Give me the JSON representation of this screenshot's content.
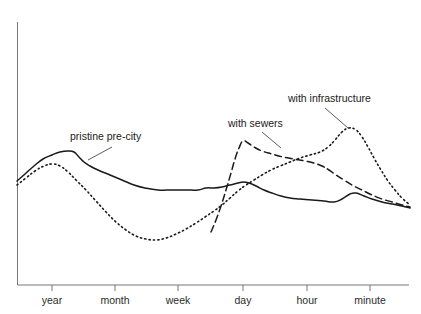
{
  "chart_data": {
    "type": "line",
    "title": "",
    "subtitle": "",
    "xlabel": "",
    "ylabel": "",
    "grid": false,
    "legend_position": "inline-annotations",
    "x_axis": {
      "tick_labels": [
        "year",
        "month",
        "week",
        "day",
        "hour",
        "minute"
      ],
      "tick_positions_px": [
        52,
        115,
        178,
        243,
        307,
        370
      ],
      "note": "logarithmic time-scale axis, decreasing timescale left to right"
    },
    "y_axis": {
      "tick_labels": [],
      "range_px": [
        22,
        285
      ],
      "note": "unlabeled vertical axis"
    },
    "series": [
      {
        "name": "pristine pre-city",
        "style": "solid",
        "color": "#1a1a1a",
        "label": "pristine pre-city",
        "label_x": 70,
        "label_y": 140,
        "leader": [
          [
            88,
            160
          ],
          [
            112,
            147
          ]
        ],
        "points": [
          [
            17,
            181
          ],
          [
            25,
            174
          ],
          [
            34,
            166
          ],
          [
            43,
            159
          ],
          [
            52,
            155
          ],
          [
            60,
            152
          ],
          [
            68,
            151
          ],
          [
            74,
            152
          ],
          [
            79,
            157
          ],
          [
            84,
            162
          ],
          [
            90,
            166
          ],
          [
            98,
            170
          ],
          [
            110,
            175
          ],
          [
            122,
            180
          ],
          [
            134,
            185
          ],
          [
            145,
            188
          ],
          [
            158,
            190
          ],
          [
            172,
            190
          ],
          [
            186,
            190
          ],
          [
            198,
            190
          ],
          [
            206,
            188
          ],
          [
            214,
            188
          ],
          [
            222,
            187
          ],
          [
            230,
            185
          ],
          [
            238,
            183
          ],
          [
            243,
            182
          ],
          [
            249,
            183
          ],
          [
            256,
            186
          ],
          [
            264,
            190
          ],
          [
            272,
            193
          ],
          [
            281,
            196
          ],
          [
            290,
            198
          ],
          [
            300,
            199
          ],
          [
            312,
            200
          ],
          [
            324,
            201
          ],
          [
            334,
            202
          ],
          [
            342,
            199
          ],
          [
            350,
            194
          ],
          [
            356,
            193
          ],
          [
            364,
            196
          ],
          [
            372,
            199
          ],
          [
            382,
            202
          ],
          [
            392,
            204
          ],
          [
            402,
            206
          ],
          [
            410,
            208
          ]
        ]
      },
      {
        "name": "with sewers",
        "style": "dashed",
        "color": "#1a1a1a",
        "label": "with sewers",
        "label_x": 228,
        "label_y": 127,
        "leader": [
          [
            262,
            132
          ],
          [
            281,
            148
          ]
        ],
        "points": [
          [
            211,
            232
          ],
          [
            216,
            220
          ],
          [
            221,
            206
          ],
          [
            226,
            190
          ],
          [
            231,
            173
          ],
          [
            235,
            159
          ],
          [
            239,
            148
          ],
          [
            243,
            141
          ],
          [
            248,
            143
          ],
          [
            254,
            147
          ],
          [
            262,
            151
          ],
          [
            272,
            154
          ],
          [
            283,
            157
          ],
          [
            294,
            159
          ],
          [
            305,
            161
          ],
          [
            314,
            163
          ],
          [
            322,
            166
          ],
          [
            329,
            170
          ],
          [
            336,
            175
          ],
          [
            344,
            180
          ],
          [
            352,
            185
          ],
          [
            362,
            190
          ],
          [
            372,
            195
          ],
          [
            382,
            199
          ],
          [
            392,
            202
          ],
          [
            402,
            205
          ],
          [
            410,
            207
          ]
        ]
      },
      {
        "name": "with infrastructure",
        "style": "dotted",
        "color": "#1a1a1a",
        "label": "with infrastructure",
        "label_x": 288,
        "label_y": 102,
        "leader": [
          [
            325,
            108
          ],
          [
            348,
            128
          ]
        ],
        "points": [
          [
            17,
            185
          ],
          [
            26,
            178
          ],
          [
            35,
            171
          ],
          [
            44,
            166
          ],
          [
            52,
            164
          ],
          [
            60,
            166
          ],
          [
            68,
            172
          ],
          [
            76,
            180
          ],
          [
            86,
            190
          ],
          [
            96,
            201
          ],
          [
            106,
            212
          ],
          [
            116,
            222
          ],
          [
            126,
            230
          ],
          [
            136,
            236
          ],
          [
            146,
            239
          ],
          [
            156,
            240
          ],
          [
            166,
            238
          ],
          [
            176,
            234
          ],
          [
            186,
            229
          ],
          [
            196,
            223
          ],
          [
            205,
            217
          ],
          [
            214,
            211
          ],
          [
            222,
            205
          ],
          [
            230,
            198
          ],
          [
            238,
            191
          ],
          [
            246,
            185
          ],
          [
            254,
            180
          ],
          [
            262,
            175
          ],
          [
            271,
            170
          ],
          [
            280,
            166
          ],
          [
            290,
            162
          ],
          [
            300,
            158
          ],
          [
            310,
            155
          ],
          [
            320,
            152
          ],
          [
            328,
            147
          ],
          [
            335,
            140
          ],
          [
            342,
            132
          ],
          [
            349,
            128
          ],
          [
            356,
            130
          ],
          [
            362,
            137
          ],
          [
            368,
            147
          ],
          [
            374,
            158
          ],
          [
            381,
            170
          ],
          [
            388,
            181
          ],
          [
            395,
            190
          ],
          [
            402,
            198
          ],
          [
            410,
            205
          ]
        ]
      }
    ]
  }
}
